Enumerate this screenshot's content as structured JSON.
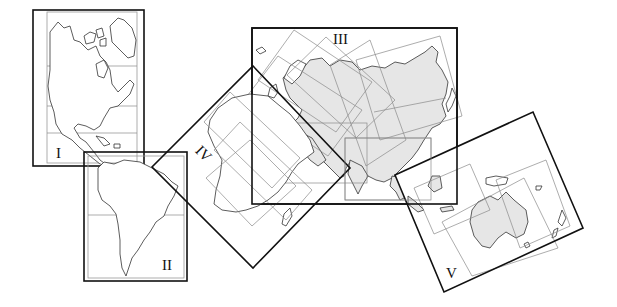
{
  "diagram": {
    "title": "",
    "sections": [
      {
        "id": "I",
        "label": "I",
        "region": "North America"
      },
      {
        "id": "II",
        "label": "II",
        "region": "South America"
      },
      {
        "id": "III",
        "label": "III",
        "region": "Eurasia"
      },
      {
        "id": "IV",
        "label": "IV",
        "region": "Africa"
      },
      {
        "id": "V",
        "label": "V",
        "region": "Australia / Oceania"
      }
    ],
    "colors": {
      "frame": "#111111",
      "grid": "#8a8a8a",
      "land_shaded": "#e6e6e6",
      "background": "#ffffff"
    }
  }
}
